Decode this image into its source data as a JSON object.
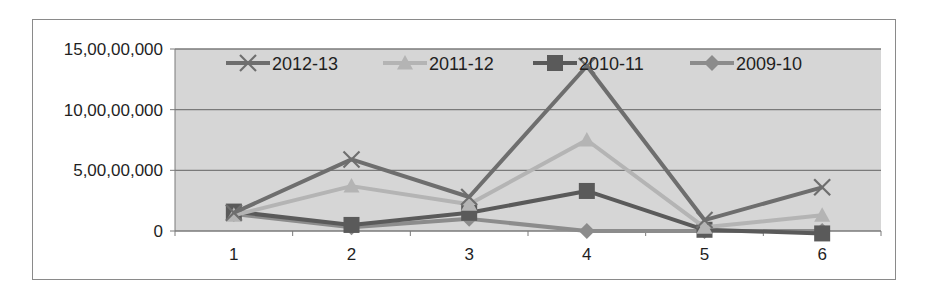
{
  "chart_data": {
    "type": "line",
    "title": "",
    "xlabel": "",
    "ylabel": "",
    "categories": [
      "1",
      "2",
      "3",
      "4",
      "5",
      "6"
    ],
    "y_tick_labels": [
      "0",
      "5,00,00,000",
      "10,00,00,000",
      "15,00,00,000"
    ],
    "y_ticks": [
      0,
      50000000,
      100000000,
      150000000
    ],
    "ylim": [
      0,
      150000000
    ],
    "grid": true,
    "legend_position": "top-inside",
    "series": [
      {
        "name": "2012-13",
        "marker": "x",
        "color": "#6e6e6e",
        "values": [
          15000000,
          59000000,
          28000000,
          136000000,
          9000000,
          36000000
        ]
      },
      {
        "name": "2011-12",
        "marker": "triangle",
        "color": "#b4b4b4",
        "values": [
          13000000,
          37000000,
          22000000,
          75000000,
          3000000,
          13000000
        ]
      },
      {
        "name": "2010-11",
        "marker": "square",
        "color": "#5a5a5a",
        "values": [
          16000000,
          5000000,
          15000000,
          33000000,
          1000000,
          -2000000
        ]
      },
      {
        "name": "2009-10",
        "marker": "diamond",
        "color": "#8c8c8c",
        "values": [
          14000000,
          3000000,
          10000000,
          0,
          0,
          0
        ]
      }
    ]
  },
  "colors": {
    "plot_background": "#d6d6d6",
    "gridline": "#7a7a7a",
    "frame_border": "#8a8a8a",
    "text": "#1f1f1f"
  }
}
